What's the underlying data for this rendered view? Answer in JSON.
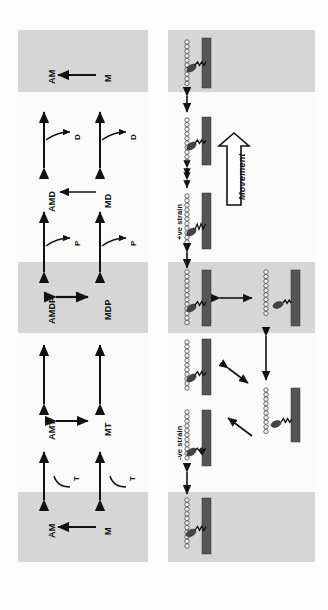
{
  "figure": {
    "orientation": "rotated-90",
    "colors": {
      "band": "#d6d6d6",
      "panel": "#fbfbfb",
      "myosin_filament": "#555555",
      "myosin_head": "#444444",
      "actin_bead": "#f2f2f2",
      "ink": "#111111"
    }
  },
  "left_panel": {
    "name": "biochemical-scheme",
    "attached_states": [
      {
        "id": "am-bottom",
        "label": "AM"
      },
      {
        "id": "amt",
        "label": "AMT"
      },
      {
        "id": "amdp",
        "label": "AMDP"
      },
      {
        "id": "amd",
        "label": "AMD"
      },
      {
        "id": "am-top",
        "label": "AM"
      }
    ],
    "detached_states": [
      {
        "id": "m-bottom",
        "label": "M"
      },
      {
        "id": "mt",
        "label": "MT"
      },
      {
        "id": "mdp",
        "label": "MDP"
      },
      {
        "id": "md",
        "label": "MD"
      },
      {
        "id": "m-top",
        "label": "M"
      }
    ],
    "ligands": [
      {
        "id": "t-attached",
        "label": "T"
      },
      {
        "id": "t-detached",
        "label": "T"
      },
      {
        "id": "p-attached",
        "label": "P"
      },
      {
        "id": "p-detached",
        "label": "P"
      },
      {
        "id": "d-attached",
        "label": "D"
      },
      {
        "id": "d-detached",
        "label": "D"
      }
    ]
  },
  "right_panel": {
    "name": "mechanical-states",
    "annotations": [
      {
        "id": "neg-strain",
        "label": "-ve strain"
      },
      {
        "id": "pos-strain",
        "label": "+ve strain"
      },
      {
        "id": "movement",
        "label": "Movement"
      }
    ],
    "state_count": 8
  }
}
